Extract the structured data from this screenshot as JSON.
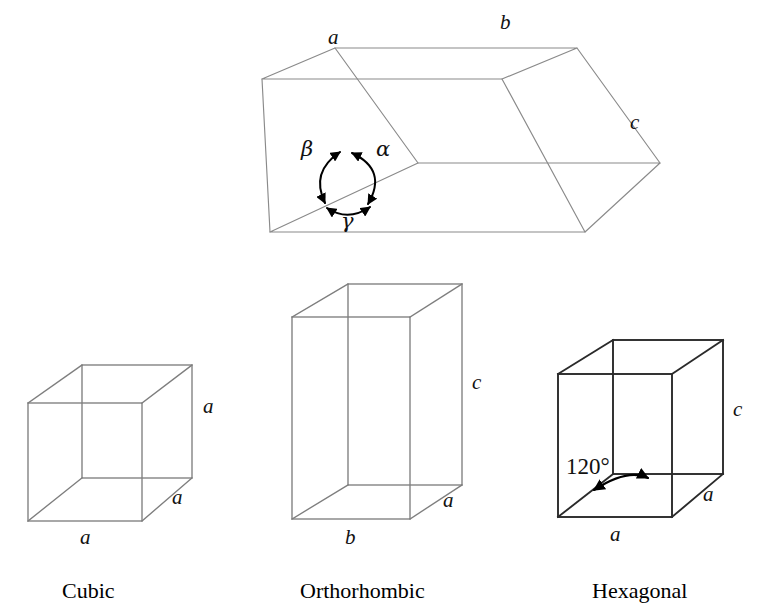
{
  "figure": {
    "background_color": "#ffffff",
    "line_color_light": "#8a8a8a",
    "line_color_dark": "#1a1a1a",
    "arc_color": "#000000"
  },
  "triclinic": {
    "name": "general-parallelepiped",
    "edge_labels": {
      "a": "a",
      "b": "b",
      "c": "c"
    },
    "angle_labels": {
      "alpha": "α",
      "beta": "β",
      "gamma": "γ"
    }
  },
  "cells": [
    {
      "id": "cubic",
      "caption": "Cubic",
      "labels": {
        "bottom": "a",
        "right_depth": "a",
        "right_vertical": "a"
      }
    },
    {
      "id": "orthorhombic",
      "caption": "Orthorhombic",
      "labels": {
        "bottom": "b",
        "right_depth": "a",
        "right_vertical": "c"
      }
    },
    {
      "id": "hexagonal",
      "caption": "Hexagonal",
      "labels": {
        "bottom": "a",
        "right_depth": "a",
        "right_vertical": "c",
        "angle": "120°"
      }
    }
  ]
}
